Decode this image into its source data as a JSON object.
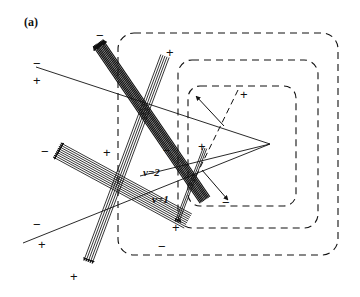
{
  "figure": {
    "panel_label": "(a)",
    "background_color": "#ffffff",
    "ink_color": "#111111",
    "width": 360,
    "height": 297
  },
  "order_labels": [
    {
      "text": "ν=2",
      "x": 143,
      "y": 167
    },
    {
      "text": "ν=1",
      "x": 152,
      "y": 194
    }
  ],
  "sign_labels": [
    {
      "text": "−",
      "x": 33,
      "y": 57
    },
    {
      "text": "+",
      "x": 33,
      "y": 74
    },
    {
      "text": "−",
      "x": 96,
      "y": 29
    },
    {
      "text": "+",
      "x": 166,
      "y": 46
    },
    {
      "text": "+",
      "x": 240,
      "y": 88
    },
    {
      "text": "−",
      "x": 41,
      "y": 145
    },
    {
      "text": "+",
      "x": 103,
      "y": 146
    },
    {
      "text": "−",
      "x": 163,
      "y": 144
    },
    {
      "text": "+",
      "x": 198,
      "y": 140
    },
    {
      "text": "−",
      "x": 222,
      "y": 196
    },
    {
      "text": "−",
      "x": 33,
      "y": 218
    },
    {
      "text": "+",
      "x": 38,
      "y": 238
    },
    {
      "text": "+",
      "x": 172,
      "y": 221
    },
    {
      "text": "−",
      "x": 158,
      "y": 240
    },
    {
      "text": "+",
      "x": 70,
      "y": 270
    }
  ],
  "dashed_regions": [
    {
      "name": "outer-dashed-region",
      "x": 118,
      "y": 33,
      "w": 220,
      "h": 222,
      "r": 16
    },
    {
      "name": "middle-dashed-region",
      "x": 178,
      "y": 60,
      "w": 140,
      "h": 168,
      "r": 14
    },
    {
      "name": "inner-dashed-region",
      "x": 188,
      "y": 86,
      "w": 108,
      "h": 120,
      "r": 12
    }
  ],
  "beams": [
    {
      "name": "upper-left-dense-beam",
      "x1": 98,
      "y1": 43,
      "x2": 205,
      "y2": 200,
      "count": 9,
      "spacing": 1.45,
      "thick": true,
      "arrow_end": "start"
    },
    {
      "name": "left-fan-beam",
      "x1": 57,
      "y1": 150,
      "x2": 188,
      "y2": 221,
      "count": 9,
      "spacing": 2.0,
      "thick": false,
      "arrow_end": "start"
    },
    {
      "name": "lower-descending-beam",
      "x1": 165,
      "y1": 56,
      "x2": 88,
      "y2": 262,
      "count": 5,
      "spacing": 2.2,
      "thick": false,
      "arrow_end": "end"
    },
    {
      "name": "right-short-beam",
      "x1": 205,
      "y1": 148,
      "x2": 177,
      "y2": 222,
      "count": 3,
      "spacing": 1.8,
      "thick": false,
      "arrow_end": "end"
    }
  ],
  "guide_lines": [
    {
      "name": "upper-left-long-line",
      "x1": 36,
      "y1": 67,
      "x2": 270,
      "y2": 144
    },
    {
      "name": "lower-left-long-line",
      "x1": 23,
      "y1": 243,
      "x2": 270,
      "y2": 144
    },
    {
      "name": "order-line-nu2",
      "x1": 140,
      "y1": 176,
      "x2": 270,
      "y2": 144
    }
  ],
  "vertex_arrows": [
    {
      "name": "arrow-upper-left",
      "x1": 224,
      "y1": 126,
      "x2": 196,
      "y2": 96
    },
    {
      "name": "arrow-lower-right",
      "x1": 202,
      "y1": 170,
      "x2": 228,
      "y2": 200
    },
    {
      "name": "dashed-ray",
      "x1": 238,
      "y1": 90,
      "x2": 196,
      "y2": 176,
      "dashed": true
    }
  ]
}
